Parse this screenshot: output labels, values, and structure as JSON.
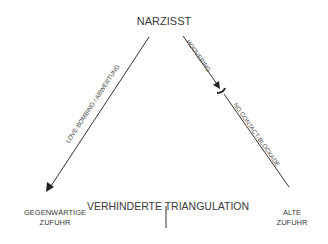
{
  "diagram": {
    "nodes": {
      "top": "NARZISST",
      "middle": "VERHINDERTE TRIANGULATION",
      "left_line1": "GEGENWÄRTIGE",
      "left_line2": "ZUFUHR",
      "right_line1": "ALTE",
      "right_line2": "ZUFUHR"
    },
    "edges": {
      "left": "LOVE-BOMBING / ABWERTUNG",
      "right_upper": "HOOVERING",
      "right_lower": "NO CONTACT-BLOCKADE"
    },
    "colors": {
      "line": "#333333",
      "text": "#3a3a3a",
      "background": "#ffffff"
    }
  }
}
